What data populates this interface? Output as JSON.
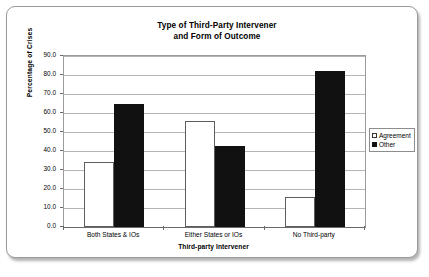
{
  "chart_data": {
    "type": "bar",
    "title": "Type of Third-Party Intervener and Form of Outcome",
    "title_line1": "Type of Third-Party Intervener",
    "title_line2": "and Form of Outcome",
    "xlabel": "Third-party Intervener",
    "ylabel": "Percentage of Crises",
    "categories": [
      "Both States & IOs",
      "Either States or IOs",
      "No Third-party"
    ],
    "series": [
      {
        "name": "Agreement",
        "color": "#ffffff",
        "values": [
          34.0,
          56.0,
          16.0
        ]
      },
      {
        "name": "Other",
        "color": "#111111",
        "values": [
          65.0,
          42.5,
          82.0
        ]
      }
    ],
    "ylim": [
      0.0,
      90.0
    ],
    "ytick_step": 10.0,
    "ytick_labels": [
      "90.0",
      "80.0",
      "70.0",
      "60.0",
      "50.0",
      "40.0",
      "30.0",
      "20.0",
      "10.0",
      "0.0"
    ],
    "ytick_values": [
      90.0,
      80.0,
      70.0,
      60.0,
      50.0,
      40.0,
      30.0,
      20.0,
      10.0,
      0.0
    ],
    "grid": true,
    "legend_position": "right",
    "legend_entries": [
      "Agreement",
      "Other"
    ]
  },
  "legend": {
    "items": [
      {
        "label": "Agreement",
        "swatch": "hollow-square-icon"
      },
      {
        "label": "Other",
        "swatch": "filled-square-icon"
      }
    ]
  }
}
